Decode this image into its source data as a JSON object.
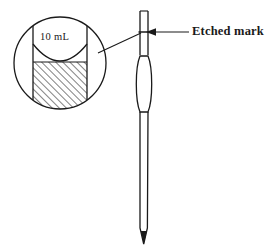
{
  "figure": {
    "kind": "volumetric-pipette-diagram",
    "background_color": "#ffffff",
    "stroke_color": "#1a1a1a",
    "annotations": {
      "etched_mark_label": "Etched mark",
      "volume_label": "10 mL"
    },
    "magnifier": {
      "name": "meniscus-detail-circle",
      "center_x": 60,
      "center_y": 63,
      "radius": 46,
      "tube_left_x": 33,
      "tube_right_x": 87,
      "liquid_level_y": 62,
      "hatch_fill_color": "#ffffff",
      "hatch_line_color": "#1a1a1a"
    },
    "pipette": {
      "name": "volumetric-pipette",
      "top_y": 10,
      "tip_y": 244,
      "stem_left_x": 140,
      "stem_right_x": 148,
      "bulb_top_y": 53,
      "bulb_bottom_y": 115,
      "bulb_left_x": 136,
      "bulb_right_x": 152,
      "etched_mark_y": 32
    },
    "pointer": {
      "name": "etched-mark-arrow",
      "arrow_tip_x": 146,
      "arrow_tip_y": 32,
      "line_end_x": 189,
      "line_end_y": 32
    },
    "leader": {
      "name": "magnifier-leader-line",
      "from_x": 98,
      "from_y": 53,
      "to_x": 141,
      "to_y": 33
    }
  }
}
